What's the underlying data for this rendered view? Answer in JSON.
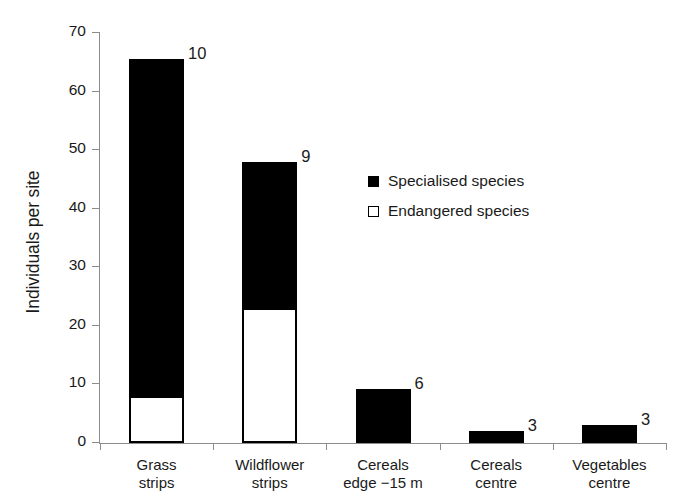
{
  "chart_data": {
    "type": "bar",
    "title": "",
    "subtitle": "",
    "xlabel": "",
    "ylabel": "Individuals per site",
    "ylim": [
      0,
      70
    ],
    "yticks": [
      0,
      10,
      20,
      30,
      40,
      50,
      60,
      70
    ],
    "grid": false,
    "stacked": true,
    "legend_position": "center-right",
    "categories": [
      "Grass\nstrips",
      "Wildflower\nstrips",
      "Cereals\nedge −15 m",
      "Cereals\ncentre",
      "Vegetables\ncentre"
    ],
    "category_lines": [
      [
        "Grass",
        "strips"
      ],
      [
        "Wildflower",
        "strips"
      ],
      [
        "Cereals",
        "edge −15 m"
      ],
      [
        "Cereals",
        "centre"
      ],
      [
        "Vegetables",
        "centre"
      ]
    ],
    "series": [
      {
        "name": "Specialised species",
        "color": "#000000",
        "style": "filled",
        "values": [
          57.5,
          25,
          8.6,
          1.4,
          2.3
        ]
      },
      {
        "name": "Endangered species",
        "color": "#ffffff",
        "style": "hollow",
        "values": [
          8,
          23,
          0.7,
          0.7,
          0.7
        ]
      }
    ],
    "totals": [
      65.5,
      48,
      9.3,
      2.1,
      3.0
    ],
    "bar_labels": [
      "10",
      "9",
      "6",
      "3",
      "3"
    ],
    "bar_label_meaning": "number above each bar"
  },
  "legend": {
    "items": [
      {
        "label": "Specialised species",
        "style": "filled"
      },
      {
        "label": "Endangered species",
        "style": "hollow"
      }
    ]
  },
  "axes": {
    "y_title": "Individuals per site",
    "y_tick_labels": [
      "0",
      "10",
      "20",
      "30",
      "40",
      "50",
      "60",
      "70"
    ]
  }
}
